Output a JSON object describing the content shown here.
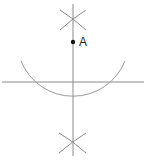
{
  "diagram": {
    "colors": {
      "background": "#ffffff",
      "line": "#8a8a8a",
      "arc": "#9a9a9a",
      "point": "#111111",
      "label": "#222222"
    },
    "point": {
      "label": "A",
      "x": 73,
      "y": 42
    },
    "horizontal_line": {
      "x1": 2,
      "y1": 82,
      "x2": 144,
      "y2": 82
    },
    "vertical_line": {
      "x1": 73,
      "y1": 4,
      "x2": 73,
      "y2": 156
    },
    "arc": {
      "cx": 73,
      "cy": 42,
      "r": 56,
      "start_x": 21,
      "start_y": 61,
      "end_x": 125,
      "end_y": 61
    },
    "top_cross": {
      "cx": 73,
      "cy": 20
    },
    "bottom_cross": {
      "cx": 73,
      "cy": 143
    }
  }
}
